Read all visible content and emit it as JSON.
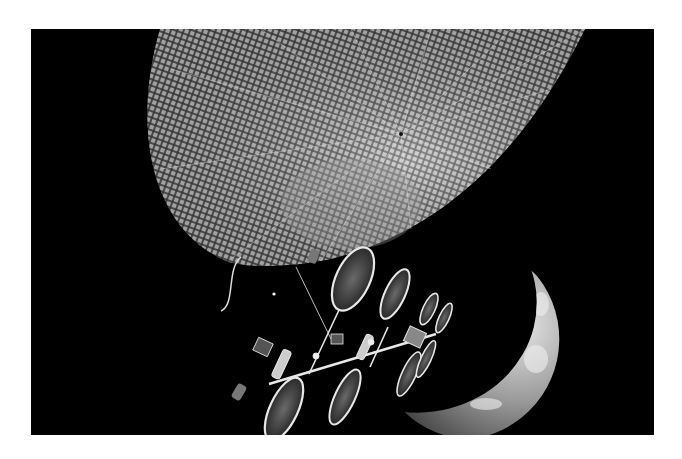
{
  "image": {
    "description": "Black-and-white space art: a large mesh solar reflector dish, an orbital station with oval solar panels, and a crescent planet",
    "background": "#000000",
    "border_color": "#ffffff",
    "elements": [
      {
        "name": "mesh-reflector-dish",
        "tone": "light gray mesh"
      },
      {
        "name": "crescent-planet",
        "tone": "gray with cloud patterns"
      },
      {
        "name": "space-station",
        "tone": "metallic white"
      },
      {
        "name": "oval-solar-panels",
        "count": 8
      },
      {
        "name": "small-star",
        "tone": "white"
      }
    ]
  }
}
